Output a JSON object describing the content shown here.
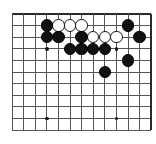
{
  "diagram": {
    "kind": "go-board-diagram",
    "board": {
      "columns": 12,
      "rows": 10,
      "left_px": 12,
      "top_px": 14,
      "spacing_px": 11.6,
      "edge_line_color": "#2b2b2b",
      "inner_line_color": "#555555",
      "background_color": "#ffffff",
      "border_style": "thick-top-right-edge",
      "stone_radius_px": 6.2
    },
    "star_points": [
      {
        "name": "hoshi-upper-left",
        "col": 3,
        "row": 3
      },
      {
        "name": "hoshi-upper-right",
        "col": 9,
        "row": 3
      },
      {
        "name": "hoshi-lower-left",
        "col": 3,
        "row": 9
      },
      {
        "name": "hoshi-lower-right",
        "col": 9,
        "row": 9
      }
    ],
    "stones": [
      {
        "name": "black-stone-c1",
        "color": "black",
        "col": 3,
        "row": 1
      },
      {
        "name": "white-stone-d1",
        "color": "white",
        "col": 4,
        "row": 1
      },
      {
        "name": "white-stone-e1",
        "color": "white",
        "col": 5,
        "row": 1
      },
      {
        "name": "white-stone-f1",
        "color": "white",
        "col": 6,
        "row": 1
      },
      {
        "name": "black-stone-k1",
        "color": "black",
        "col": 10,
        "row": 1
      },
      {
        "name": "black-stone-c2",
        "color": "black",
        "col": 3,
        "row": 2
      },
      {
        "name": "black-stone-d2",
        "color": "black",
        "col": 4,
        "row": 2
      },
      {
        "name": "black-stone-f2",
        "color": "black",
        "col": 6,
        "row": 2
      },
      {
        "name": "white-stone-g2",
        "color": "white",
        "col": 7,
        "row": 2
      },
      {
        "name": "white-stone-h2",
        "color": "white",
        "col": 8,
        "row": 2
      },
      {
        "name": "white-stone-j2",
        "color": "white",
        "col": 9,
        "row": 2
      },
      {
        "name": "black-stone-l2",
        "color": "black",
        "col": 11,
        "row": 2
      },
      {
        "name": "black-stone-e3",
        "color": "black",
        "col": 5,
        "row": 3
      },
      {
        "name": "black-stone-f3",
        "color": "black",
        "col": 6,
        "row": 3
      },
      {
        "name": "black-stone-g3",
        "color": "black",
        "col": 7,
        "row": 3
      },
      {
        "name": "black-stone-h3",
        "color": "black",
        "col": 8,
        "row": 3
      },
      {
        "name": "black-stone-k4",
        "color": "black",
        "col": 10,
        "row": 4
      },
      {
        "name": "black-stone-h5",
        "color": "black",
        "col": 8,
        "row": 5
      }
    ],
    "counts": {
      "black_stones": "12",
      "white_stones": "6",
      "total_stones": "18"
    }
  }
}
